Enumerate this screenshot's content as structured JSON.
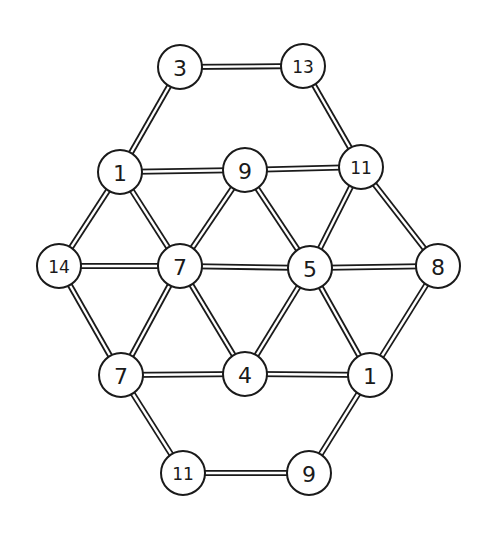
{
  "diagram": {
    "type": "graph",
    "node_radius": 22,
    "colors": {
      "line": "#1a1a1a",
      "background": "#ffffff"
    },
    "nodes": [
      {
        "id": "n_top_left",
        "label": "3",
        "x": 180,
        "y": 67
      },
      {
        "id": "n_top_right",
        "label": "13",
        "x": 303,
        "y": 66
      },
      {
        "id": "n_r2_left",
        "label": "1",
        "x": 120,
        "y": 172
      },
      {
        "id": "n_r2_mid",
        "label": "9",
        "x": 245,
        "y": 170
      },
      {
        "id": "n_r2_right",
        "label": "11",
        "x": 361,
        "y": 167
      },
      {
        "id": "n_r3_far_left",
        "label": "14",
        "x": 59,
        "y": 266
      },
      {
        "id": "n_r3_left",
        "label": "7",
        "x": 180,
        "y": 266
      },
      {
        "id": "n_r3_right",
        "label": "5",
        "x": 310,
        "y": 268
      },
      {
        "id": "n_r3_far_right",
        "label": "8",
        "x": 438,
        "y": 266
      },
      {
        "id": "n_r4_left",
        "label": "7",
        "x": 121,
        "y": 375
      },
      {
        "id": "n_r4_mid",
        "label": "4",
        "x": 245,
        "y": 374
      },
      {
        "id": "n_r4_right",
        "label": "1",
        "x": 370,
        "y": 375
      },
      {
        "id": "n_bot_left",
        "label": "11",
        "x": 183,
        "y": 473
      },
      {
        "id": "n_bot_right",
        "label": "9",
        "x": 309,
        "y": 473
      }
    ],
    "edges": [
      [
        "n_top_left",
        "n_top_right"
      ],
      [
        "n_top_left",
        "n_r2_left"
      ],
      [
        "n_top_right",
        "n_r2_right"
      ],
      [
        "n_r2_left",
        "n_r2_mid"
      ],
      [
        "n_r2_mid",
        "n_r2_right"
      ],
      [
        "n_r2_left",
        "n_r3_far_left"
      ],
      [
        "n_r2_left",
        "n_r3_left"
      ],
      [
        "n_r2_mid",
        "n_r3_left"
      ],
      [
        "n_r2_mid",
        "n_r3_right"
      ],
      [
        "n_r2_right",
        "n_r3_right"
      ],
      [
        "n_r2_right",
        "n_r3_far_right"
      ],
      [
        "n_r3_far_left",
        "n_r3_left"
      ],
      [
        "n_r3_left",
        "n_r3_right"
      ],
      [
        "n_r3_right",
        "n_r3_far_right"
      ],
      [
        "n_r3_far_left",
        "n_r4_left"
      ],
      [
        "n_r3_left",
        "n_r4_left"
      ],
      [
        "n_r3_left",
        "n_r4_mid"
      ],
      [
        "n_r3_right",
        "n_r4_mid"
      ],
      [
        "n_r3_right",
        "n_r4_right"
      ],
      [
        "n_r3_far_right",
        "n_r4_right"
      ],
      [
        "n_r4_left",
        "n_r4_mid"
      ],
      [
        "n_r4_mid",
        "n_r4_right"
      ],
      [
        "n_r4_left",
        "n_bot_left"
      ],
      [
        "n_r4_right",
        "n_bot_right"
      ],
      [
        "n_bot_left",
        "n_bot_right"
      ]
    ]
  }
}
